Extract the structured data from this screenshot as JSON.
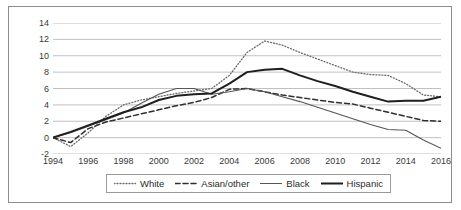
{
  "chart_data": {
    "type": "line",
    "title": "",
    "subtitle": "",
    "xlabel": "",
    "ylabel": "",
    "xlim": [
      1994,
      2016
    ],
    "ylim": [
      -2,
      14
    ],
    "y_ticks": [
      14,
      12,
      10,
      8,
      6,
      4,
      2,
      0,
      -2
    ],
    "x_ticks": [
      1994,
      1996,
      1998,
      2000,
      2002,
      2004,
      2006,
      2008,
      2010,
      2012,
      2014,
      2016
    ],
    "grid": "horizontal",
    "legend_position": "bottom",
    "x": [
      1994,
      1995,
      1996,
      1997,
      1998,
      1999,
      2000,
      2001,
      2002,
      2003,
      2004,
      2005,
      2006,
      2007,
      2008,
      2009,
      2010,
      2011,
      2012,
      2013,
      2014,
      2015,
      2016
    ],
    "series": [
      {
        "name": "White",
        "style": "dotted",
        "color": "#6b6b6b",
        "width": 1.3,
        "values": [
          0.0,
          -1.1,
          0.6,
          2.6,
          4.0,
          4.6,
          5.0,
          5.4,
          5.7,
          6.0,
          7.6,
          10.4,
          11.8,
          11.3,
          10.4,
          9.6,
          8.8,
          8.0,
          7.7,
          7.6,
          6.6,
          5.2,
          5.0
        ]
      },
      {
        "name": "Asian/other",
        "style": "dashed",
        "color": "#2f2f2f",
        "width": 1.5,
        "values": [
          0.0,
          -0.6,
          1.1,
          1.9,
          2.4,
          2.9,
          3.4,
          3.9,
          4.3,
          4.9,
          5.9,
          6.0,
          5.6,
          5.2,
          4.9,
          4.6,
          4.3,
          4.1,
          3.6,
          3.1,
          2.6,
          2.1,
          2.0
        ]
      },
      {
        "name": "Black",
        "style": "solid-thin",
        "color": "#555555",
        "width": 1.1,
        "values": [
          0.0,
          0.6,
          1.4,
          2.2,
          3.0,
          4.2,
          5.3,
          6.0,
          6.0,
          5.3,
          5.6,
          6.0,
          5.6,
          5.0,
          4.4,
          3.7,
          3.0,
          2.3,
          1.6,
          1.0,
          0.9,
          -0.3,
          -1.3
        ]
      },
      {
        "name": "Hispanic",
        "style": "solid-thick",
        "color": "#1f1f1f",
        "width": 2.0,
        "values": [
          0.0,
          0.7,
          1.5,
          2.3,
          3.1,
          3.7,
          4.6,
          5.1,
          5.3,
          5.4,
          6.6,
          8.0,
          8.3,
          8.4,
          7.6,
          6.9,
          6.3,
          5.6,
          5.0,
          4.4,
          4.5,
          4.5,
          5.0
        ]
      }
    ]
  },
  "legend": {
    "items": [
      {
        "label": "White"
      },
      {
        "label": "Asian/other"
      },
      {
        "label": "Black"
      },
      {
        "label": "Hispanic"
      }
    ]
  }
}
